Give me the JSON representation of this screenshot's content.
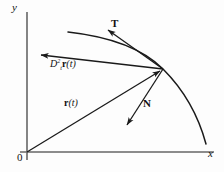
{
  "figure": {
    "type": "vector-diagram",
    "width": 224,
    "height": 172,
    "background_color": "#fdfdfd",
    "stroke_color": "#1a1a1a",
    "axis_color": "#555555"
  },
  "axes": {
    "y_label": "y",
    "x_label": "x",
    "origin_label": "0",
    "origin_point": [
      27,
      152
    ],
    "y_axis": {
      "x": 27,
      "y_top": 12,
      "y_bottom": 160
    },
    "x_axis": {
      "y": 152,
      "x_left": 20,
      "x_right": 214
    }
  },
  "curve": {
    "name": "trajectory-curve",
    "description": "Curved path through the point of tangency",
    "start_point": [
      68,
      32
    ],
    "end_point": [
      206,
      144
    ],
    "tangency_point": [
      163,
      69
    ]
  },
  "point_of_tangency": [
    163,
    69
  ],
  "vectors": [
    {
      "name": "tangent-vector",
      "label": "T",
      "label_text": "T",
      "from": [
        163,
        69
      ],
      "to": [
        105,
        28
      ],
      "label_position": [
        111,
        18
      ],
      "bold": true
    },
    {
      "name": "normal-vector",
      "label": "N",
      "label_text": "N",
      "from": [
        163,
        69
      ],
      "to": [
        124,
        128
      ],
      "label_position": [
        143,
        98
      ],
      "bold": true
    },
    {
      "name": "position-vector",
      "label": "r(t)",
      "label_text": "r(t)",
      "label_bold_part": "r",
      "label_italic_part": "(t)",
      "from": [
        27,
        152
      ],
      "to": [
        163,
        69
      ],
      "label_position": [
        64,
        98
      ],
      "bold": true
    },
    {
      "name": "second-derivative-vector",
      "label": "D2t r(t)",
      "label_text": "D",
      "label_superscript": "2",
      "label_subscript": "t",
      "label_function": "r(t)",
      "from": [
        163,
        69
      ],
      "to": [
        38,
        55
      ],
      "label_position": [
        50,
        58
      ],
      "bold": false
    }
  ],
  "labels": {
    "y": "y",
    "x": "x",
    "origin": "0",
    "tangent": "T",
    "normal": "N",
    "position_r": "r",
    "position_arg": "(t)",
    "deriv_D": "D",
    "deriv_sup": "2",
    "deriv_sub": "t",
    "deriv_r": "r",
    "deriv_arg": "(t)"
  }
}
